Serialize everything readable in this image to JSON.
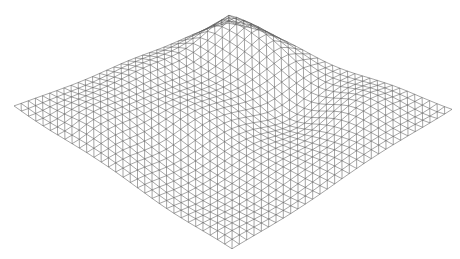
{
  "image": {
    "kind": "wireframe terrain mesh",
    "background": "#ffffff",
    "line_color": "#5a5a5a",
    "line_width": 0.55
  },
  "mesh": {
    "grid_size": 30,
    "corners": {
      "top": [
        228,
        30
      ],
      "right": [
        452,
        108
      ],
      "bottom": [
        232,
        250
      ],
      "left": [
        14,
        106
      ]
    },
    "height_scale": 26,
    "peaks": [
      {
        "u": 0.08,
        "v": 0.1,
        "h": 1.0,
        "r": 0.22
      },
      {
        "u": 0.3,
        "v": 0.05,
        "h": 0.6,
        "r": 0.18
      },
      {
        "u": 0.05,
        "v": 0.45,
        "h": 0.5,
        "r": 0.18
      },
      {
        "u": 0.55,
        "v": 0.3,
        "h": -0.5,
        "r": 0.15
      },
      {
        "u": 0.4,
        "v": 0.6,
        "h": 0.4,
        "r": 0.16
      },
      {
        "u": 0.75,
        "v": 0.2,
        "h": 0.35,
        "r": 0.15
      },
      {
        "u": 0.7,
        "v": 0.75,
        "h": -0.35,
        "r": 0.18
      },
      {
        "u": 0.25,
        "v": 0.85,
        "h": 0.3,
        "r": 0.15
      }
    ]
  }
}
